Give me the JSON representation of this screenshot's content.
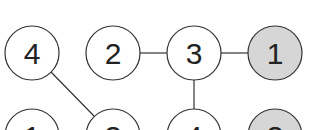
{
  "diagram": {
    "type": "graph",
    "colors": {
      "stroke": "#333333",
      "fill_default": "#ffffff",
      "fill_shaded": "#d6d6d6"
    },
    "nodes": [
      {
        "id": "t1",
        "label": "4",
        "row": "top",
        "col": 0,
        "shaded": false
      },
      {
        "id": "t2",
        "label": "2",
        "row": "top",
        "col": 1,
        "shaded": false
      },
      {
        "id": "t3",
        "label": "3",
        "row": "top",
        "col": 2,
        "shaded": false
      },
      {
        "id": "t4",
        "label": "1",
        "row": "top",
        "col": 3,
        "shaded": true
      },
      {
        "id": "b1",
        "label": "1",
        "row": "bottom",
        "col": 0,
        "shaded": false
      },
      {
        "id": "b2",
        "label": "3",
        "row": "bottom",
        "col": 1,
        "shaded": false
      },
      {
        "id": "b3",
        "label": "4",
        "row": "bottom",
        "col": 2,
        "shaded": false
      },
      {
        "id": "b4",
        "label": "3",
        "row": "bottom",
        "col": 3,
        "shaded": true
      }
    ],
    "edges": [
      {
        "from": "t2",
        "to": "t3"
      },
      {
        "from": "t3",
        "to": "t4"
      },
      {
        "from": "t1",
        "to": "b2"
      },
      {
        "from": "t3",
        "to": "b3"
      }
    ]
  }
}
